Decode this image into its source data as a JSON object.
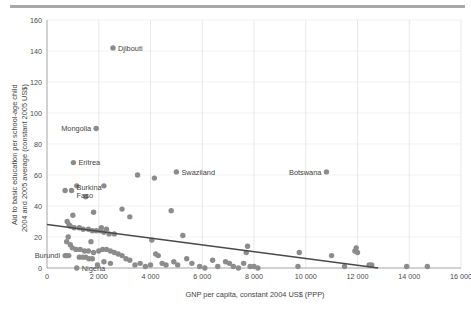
{
  "chart_data": {
    "type": "scatter",
    "title": "",
    "xlabel": "GNP per capita, constant 2004 US$ (PPP)",
    "ylabel": "Aid to basic education per school-age child 2004 and 2005 average (constant 2005 US$)",
    "ylabel_line1": "Aid to basic education per school-age child",
    "ylabel_line2": "2004 and 2005 average (constant 2005 US$)",
    "xlim": [
      0,
      16000
    ],
    "ylim": [
      0,
      160
    ],
    "xticks": [
      0,
      2000,
      4000,
      6000,
      8000,
      10000,
      12000,
      14000,
      16000
    ],
    "xtick_labels": [
      "0",
      "2 000",
      "4 000",
      "6 000",
      "8 000",
      "10 000",
      "12 000",
      "14 000",
      "16 000"
    ],
    "yticks": [
      0,
      20,
      40,
      60,
      80,
      100,
      120,
      140,
      160
    ],
    "ytick_labels": [
      "0",
      "20",
      "40",
      "60",
      "80",
      "100",
      "120",
      "140",
      "160"
    ],
    "grid": "vertical-and-faint-horizontal",
    "legend": "none",
    "marker_color": "#8c8c8c",
    "trendline_color": "#4a4a4a",
    "trendline": {
      "x0": 0,
      "y0": 28,
      "x1": 12800,
      "y1": 0
    },
    "annotations": [
      {
        "name": "Djibouti",
        "x": 2550,
        "y": 142,
        "label_side": "right"
      },
      {
        "name": "Mongolia",
        "x": 1900,
        "y": 90,
        "label_side": "left"
      },
      {
        "name": "Eritrea",
        "x": 1020,
        "y": 68,
        "label_side": "right"
      },
      {
        "name": "Burkina Faso",
        "x": 950,
        "y": 50,
        "label_side": "right"
      },
      {
        "name": "Swaziland",
        "x": 5000,
        "y": 62,
        "label_side": "right"
      },
      {
        "name": "Botswana",
        "x": 10800,
        "y": 62,
        "label_side": "left"
      },
      {
        "name": "Burundi",
        "x": 700,
        "y": 8,
        "label_side": "left"
      },
      {
        "name": "Nigeria",
        "x": 1150,
        "y": 0,
        "label_side": "right"
      }
    ],
    "points": [
      [
        2550,
        142
      ],
      [
        1900,
        90
      ],
      [
        1020,
        68
      ],
      [
        700,
        50
      ],
      [
        950,
        50
      ],
      [
        5000,
        62
      ],
      [
        10800,
        62
      ],
      [
        3500,
        60
      ],
      [
        4150,
        58
      ],
      [
        2200,
        53
      ],
      [
        1150,
        53
      ],
      [
        1500,
        46
      ],
      [
        2900,
        38
      ],
      [
        4800,
        37
      ],
      [
        1800,
        36
      ],
      [
        3200,
        33
      ],
      [
        1000,
        34
      ],
      [
        780,
        30
      ],
      [
        850,
        28
      ],
      [
        900,
        27
      ],
      [
        1050,
        26
      ],
      [
        1250,
        26
      ],
      [
        1400,
        25
      ],
      [
        1600,
        25
      ],
      [
        1750,
        24
      ],
      [
        1900,
        24
      ],
      [
        2050,
        24
      ],
      [
        2200,
        23
      ],
      [
        2400,
        22
      ],
      [
        2600,
        22
      ],
      [
        2100,
        26
      ],
      [
        2300,
        25
      ],
      [
        5250,
        21
      ],
      [
        4050,
        18
      ],
      [
        1700,
        17
      ],
      [
        820,
        20
      ],
      [
        760,
        17
      ],
      [
        900,
        15
      ],
      [
        980,
        13
      ],
      [
        1120,
        12
      ],
      [
        1280,
        12
      ],
      [
        1450,
        11
      ],
      [
        1600,
        11
      ],
      [
        1800,
        10
      ],
      [
        2000,
        11
      ],
      [
        2150,
        12
      ],
      [
        2300,
        12
      ],
      [
        2450,
        11
      ],
      [
        2600,
        10
      ],
      [
        700,
        8
      ],
      [
        760,
        8
      ],
      [
        840,
        8
      ],
      [
        1250,
        7
      ],
      [
        1380,
        7
      ],
      [
        1500,
        7
      ],
      [
        1620,
        6
      ],
      [
        1750,
        6
      ],
      [
        2750,
        9
      ],
      [
        2900,
        8
      ],
      [
        3050,
        6
      ],
      [
        3200,
        5
      ],
      [
        2200,
        4
      ],
      [
        2450,
        3
      ],
      [
        1950,
        2
      ],
      [
        1150,
        0
      ],
      [
        3400,
        2
      ],
      [
        3600,
        3
      ],
      [
        3800,
        1
      ],
      [
        4000,
        2
      ],
      [
        4200,
        9
      ],
      [
        4300,
        8
      ],
      [
        4450,
        3
      ],
      [
        4600,
        2
      ],
      [
        4900,
        4
      ],
      [
        5050,
        2
      ],
      [
        5400,
        6
      ],
      [
        5600,
        3
      ],
      [
        5900,
        1
      ],
      [
        6100,
        0
      ],
      [
        6400,
        5
      ],
      [
        6600,
        1
      ],
      [
        6900,
        4
      ],
      [
        7050,
        3
      ],
      [
        7200,
        1
      ],
      [
        7400,
        0
      ],
      [
        7600,
        3
      ],
      [
        7700,
        10
      ],
      [
        7750,
        14
      ],
      [
        7850,
        1
      ],
      [
        8000,
        1
      ],
      [
        8150,
        0
      ],
      [
        9700,
        1
      ],
      [
        9750,
        10
      ],
      [
        11000,
        8
      ],
      [
        11500,
        1
      ],
      [
        11900,
        11
      ],
      [
        11950,
        13
      ],
      [
        12000,
        10
      ],
      [
        12450,
        2
      ],
      [
        12550,
        2
      ],
      [
        13900,
        1
      ],
      [
        14700,
        1
      ]
    ]
  }
}
